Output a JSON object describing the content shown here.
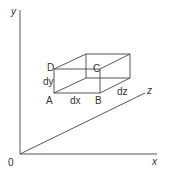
{
  "diagram": {
    "axes": {
      "x_label": "x",
      "y_label": "y",
      "z_label": "z",
      "origin_label": "0"
    },
    "box": {
      "vertex_labels": {
        "A": "A",
        "B": "B",
        "C": "C",
        "D": "D"
      },
      "edge_labels": {
        "dx": "dx",
        "dy": "dy",
        "dz": "dz"
      }
    }
  }
}
